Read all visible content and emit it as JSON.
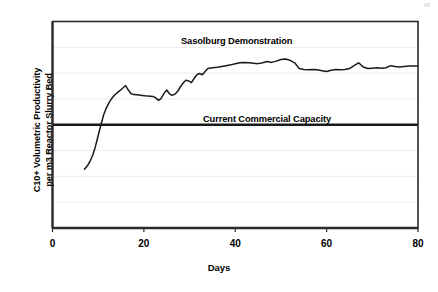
{
  "chart_data": {
    "type": "line",
    "title": "",
    "xlabel": "Days",
    "ylabel_line1": "C10+ Volumetric Productivity",
    "ylabel_line2": "per m3 Reactor Slurry Bed",
    "xlim": [
      0,
      80
    ],
    "ylim": [
      0,
      1
    ],
    "xticks": [
      0,
      20,
      40,
      60,
      80
    ],
    "xticklabels": [
      "0",
      "20",
      "40",
      "60",
      "80"
    ],
    "yticks": [
      0.125,
      0.25,
      0.375,
      0.5,
      0.625,
      0.75,
      0.875
    ],
    "yticklabels": [
      "",
      "",
      "",
      "",
      "",
      "",
      ""
    ],
    "grid": "horizontal",
    "grid_color": "#ebebeb",
    "legend": "none",
    "frame_color": "#2a2a2a",
    "line_color": "#1a1a1a",
    "annotations": [
      {
        "name": "sasolburg-demonstration-label",
        "text": "Sasolburg Demonstration",
        "x": 30,
        "y": 0.93
      },
      {
        "name": "current-commercial-capacity-label",
        "text": "Current Commercial Capacity",
        "x": 38,
        "y": 0.55
      }
    ],
    "reference_lines": [
      {
        "name": "current-commercial-capacity-line",
        "orientation": "horizontal",
        "value": 0.5,
        "color": "#1a1a1a",
        "width": 2.4,
        "label": "Current Commercial Capacity"
      }
    ],
    "series": [
      {
        "name": "Sasolburg Demonstration",
        "color": "#1a1a1a",
        "x": [
          7.0,
          7.6,
          8.2,
          8.8,
          9.4,
          10.0,
          10.6,
          11.2,
          11.8,
          12.4,
          13.0,
          13.6,
          14.2,
          14.8,
          15.4,
          16.0,
          16.6,
          17.2,
          17.8,
          18.4,
          19.0,
          19.6,
          20.2,
          20.8,
          21.4,
          22.0,
          22.6,
          23.2,
          23.8,
          24.4,
          25.0,
          25.6,
          26.2,
          26.8,
          27.4,
          28.0,
          28.6,
          29.2,
          29.8,
          30.4,
          31.0,
          31.6,
          32.2,
          32.8,
          33.4,
          34.0,
          35.0,
          36.0,
          37.0,
          38.0,
          39.0,
          40.0,
          41.0,
          42.0,
          43.0,
          44.0,
          45.0,
          46.0,
          47.0,
          48.0,
          49.0,
          50.0,
          51.0,
          52.0,
          53.0,
          54.0,
          55.0,
          56.0,
          57.0,
          58.0,
          59.0,
          60.0,
          61.0,
          62.0,
          63.0,
          64.0,
          65.0,
          66.0,
          67.0,
          68.0,
          69.0,
          70.0,
          71.0,
          72.0,
          73.0,
          74.0,
          75.0,
          76.0,
          77.0,
          78.0,
          79.0,
          80.0
        ],
        "y": [
          0.285,
          0.3,
          0.322,
          0.352,
          0.395,
          0.448,
          0.5,
          0.548,
          0.582,
          0.608,
          0.628,
          0.644,
          0.656,
          0.666,
          0.678,
          0.69,
          0.668,
          0.65,
          0.646,
          0.645,
          0.644,
          0.642,
          0.64,
          0.639,
          0.638,
          0.637,
          0.63,
          0.618,
          0.628,
          0.652,
          0.668,
          0.65,
          0.642,
          0.648,
          0.662,
          0.684,
          0.702,
          0.716,
          0.712,
          0.704,
          0.724,
          0.742,
          0.748,
          0.742,
          0.758,
          0.772,
          0.776,
          0.778,
          0.782,
          0.786,
          0.79,
          0.795,
          0.8,
          0.802,
          0.8,
          0.798,
          0.796,
          0.8,
          0.806,
          0.802,
          0.808,
          0.816,
          0.818,
          0.812,
          0.8,
          0.772,
          0.768,
          0.766,
          0.768,
          0.766,
          0.762,
          0.758,
          0.764,
          0.768,
          0.766,
          0.768,
          0.772,
          0.786,
          0.8,
          0.78,
          0.772,
          0.774,
          0.776,
          0.774,
          0.776,
          0.786,
          0.782,
          0.78,
          0.782,
          0.784,
          0.784,
          0.784
        ]
      }
    ]
  }
}
